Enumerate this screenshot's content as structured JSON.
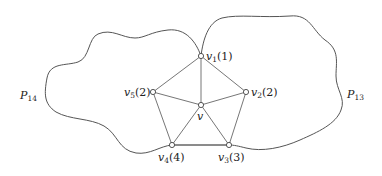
{
  "diagram": {
    "regions": [
      {
        "id": "P14",
        "label": "P",
        "subscript": "14"
      },
      {
        "id": "P13",
        "label": "P",
        "subscript": "13"
      }
    ],
    "center": {
      "id": "v",
      "label": "v"
    },
    "vertices": [
      {
        "id": "v1",
        "label": "v",
        "subscript": "1",
        "degree_label": "(1)"
      },
      {
        "id": "v2",
        "label": "v",
        "subscript": "2",
        "degree_label": "(2)"
      },
      {
        "id": "v3",
        "label": "v",
        "subscript": "3",
        "degree_label": "(3)"
      },
      {
        "id": "v4",
        "label": "v",
        "subscript": "4",
        "degree_label": "(4)"
      },
      {
        "id": "v5",
        "label": "v",
        "subscript": "5",
        "degree_label": "(2)"
      }
    ],
    "edges": [
      [
        "v",
        "v1"
      ],
      [
        "v",
        "v2"
      ],
      [
        "v",
        "v3"
      ],
      [
        "v",
        "v4"
      ],
      [
        "v",
        "v5"
      ],
      [
        "v1",
        "v2"
      ],
      [
        "v2",
        "v3"
      ],
      [
        "v3",
        "v4"
      ],
      [
        "v4",
        "v5"
      ],
      [
        "v5",
        "v1"
      ]
    ]
  }
}
